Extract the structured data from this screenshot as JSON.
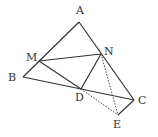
{
  "diagram": {
    "type": "geometry",
    "points": {
      "A": {
        "label": "A",
        "x": 79,
        "y": 22,
        "lx": 76,
        "ly": 14
      },
      "B": {
        "label": "B",
        "x": 23,
        "y": 77,
        "lx": 8,
        "ly": 81
      },
      "C": {
        "label": "C",
        "x": 134,
        "y": 100,
        "lx": 138,
        "ly": 104
      },
      "D": {
        "label": "D",
        "x": 81,
        "y": 89,
        "lx": 75,
        "ly": 101
      },
      "E": {
        "label": "E",
        "x": 118,
        "y": 115,
        "lx": 113,
        "ly": 128
      },
      "M": {
        "label": "M",
        "x": 39,
        "y": 61,
        "lx": 26,
        "ly": 61
      },
      "N": {
        "label": "N",
        "x": 101,
        "y": 54,
        "lx": 104,
        "ly": 55
      }
    },
    "solid_segments": [
      "AB",
      "AC",
      "BC",
      "MN",
      "MD",
      "ND",
      "CE"
    ],
    "dotted_segments": [
      "NE",
      "DE"
    ]
  }
}
